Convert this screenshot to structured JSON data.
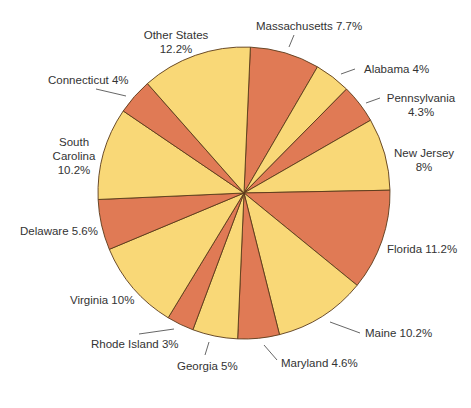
{
  "chart_data": {
    "type": "pie",
    "title": "",
    "center": [
      244,
      193
    ],
    "radius": 146,
    "start_angle_deg": 2.5,
    "direction": "clockwise",
    "colors": {
      "orange": "#E07A55",
      "yellow": "#F9D877",
      "stroke": "#5a3a1a"
    },
    "slices": [
      {
        "label": "Massachusetts",
        "value": 7.7,
        "color": "orange"
      },
      {
        "label": "Alabama",
        "value": 4,
        "color": "yellow"
      },
      {
        "label": "Pennsylvania",
        "value": 4.3,
        "color": "orange"
      },
      {
        "label": "New Jersey",
        "value": 8,
        "color": "yellow"
      },
      {
        "label": "Florida",
        "value": 11.2,
        "color": "orange"
      },
      {
        "label": "Maine",
        "value": 10.2,
        "color": "yellow"
      },
      {
        "label": "Maryland",
        "value": 4.6,
        "color": "orange"
      },
      {
        "label": "Georgia",
        "value": 5,
        "color": "yellow"
      },
      {
        "label": "Rhode Island",
        "value": 3,
        "color": "orange"
      },
      {
        "label": "Virginia",
        "value": 10,
        "color": "yellow"
      },
      {
        "label": "Delaware",
        "value": 5.6,
        "color": "orange"
      },
      {
        "label": "South Carolina",
        "value": 10.2,
        "color": "yellow"
      },
      {
        "label": "Connecticut",
        "value": 4,
        "color": "orange"
      },
      {
        "label": "Other States",
        "value": 12.2,
        "color": "yellow"
      }
    ],
    "legend": "none (direct labels with leader lines)"
  },
  "labels": {
    "massachusetts": "Massachusetts 7.7%",
    "alabama": "Alabama 4%",
    "pennsylvania_1": "Pennsylvania",
    "pennsylvania_2": "4.3%",
    "new_jersey_1": "New Jersey",
    "new_jersey_2": "8%",
    "florida": "Florida 11.2%",
    "maine": "Maine 10.2%",
    "maryland": "Maryland 4.6%",
    "georgia": "Georgia 5%",
    "rhode_island": "Rhode Island 3%",
    "virginia": "Virginia 10%",
    "delaware": "Delaware 5.6%",
    "south_carolina_1": "South",
    "south_carolina_2": "Carolina",
    "south_carolina_3": "10.2%",
    "connecticut": "Connecticut 4%",
    "other_states_1": "Other States",
    "other_states_2": "12.2%"
  }
}
